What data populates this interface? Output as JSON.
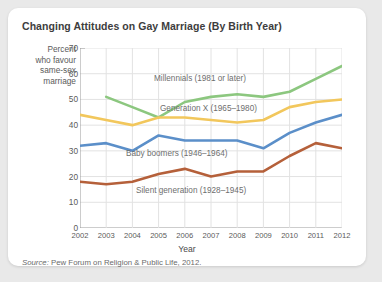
{
  "card": {
    "title": "Changing Attitudes on Gay Marriage (By Birth Year)",
    "source_prefix": "Source:",
    "source_text": " Pew Forum on Religion & Public Life, 2012."
  },
  "axis": {
    "y_axis_caption": "Percent who favour same-sex marriage",
    "y_axis_caption_lines": [
      "Percent",
      "who favour",
      "same-sex",
      "marriage"
    ],
    "x_axis_title": "Year",
    "y_ticks": [
      "0",
      "10",
      "20",
      "30",
      "40",
      "50",
      "60",
      "70"
    ],
    "x_ticks": [
      "2002",
      "2003",
      "2004",
      "2005",
      "2006",
      "2007",
      "2008",
      "2009",
      "2010",
      "2011",
      "2012"
    ]
  },
  "colors": {
    "millennials": "#8CC77F",
    "generation_x": "#F2C75C",
    "baby_boomers": "#5B8FC9",
    "silent_generation": "#B5603A",
    "grid": "#e2e2e2",
    "axis": "#9a9a9a",
    "card_bg": "#ffffff",
    "page_bg": "#e9e9e9",
    "title_text": "#3d3d3d",
    "label_text": "#6e6e6e"
  },
  "series_labels": {
    "millennials": "Millennials (1981 or later)",
    "generation_x": "Generation X (1965–1980)",
    "baby_boomers": "Baby boomers (1946–1964)",
    "silent_generation": "Silent generation (1928–1945)"
  },
  "chart_data": {
    "type": "line",
    "title": "Changing Attitudes on Gay Marriage (By Birth Year)",
    "xlabel": "Year",
    "ylabel": "Percent who favour same-sex marriage",
    "x": [
      2002,
      2003,
      2004,
      2005,
      2006,
      2007,
      2008,
      2009,
      2010,
      2011,
      2012
    ],
    "xlim": [
      2002,
      2012
    ],
    "ylim": [
      0,
      70
    ],
    "ytick_step": 10,
    "grid": true,
    "legend": "inline-labels",
    "series": [
      {
        "name": "Millennials (1981 or later)",
        "color": "#8CC77F",
        "start_year": 2003,
        "x": [
          2003,
          2004,
          2005,
          2006,
          2007,
          2008,
          2009,
          2010,
          2011,
          2012
        ],
        "values": [
          51,
          47,
          43,
          49,
          51,
          52,
          51,
          53,
          58,
          63
        ]
      },
      {
        "name": "Generation X (1965–1980)",
        "color": "#F2C75C",
        "x": [
          2002,
          2003,
          2004,
          2005,
          2006,
          2007,
          2008,
          2009,
          2010,
          2011,
          2012
        ],
        "values": [
          44,
          42,
          40,
          43,
          43,
          42,
          41,
          42,
          47,
          49,
          50
        ]
      },
      {
        "name": "Baby boomers (1946–1964)",
        "color": "#5B8FC9",
        "x": [
          2002,
          2003,
          2004,
          2005,
          2006,
          2007,
          2008,
          2009,
          2010,
          2011,
          2012
        ],
        "values": [
          32,
          33,
          30,
          36,
          34,
          34,
          34,
          31,
          37,
          41,
          44
        ]
      },
      {
        "name": "Silent generation (1928–1945)",
        "color": "#B5603A",
        "x": [
          2002,
          2003,
          2004,
          2005,
          2006,
          2007,
          2008,
          2009,
          2010,
          2011,
          2012
        ],
        "values": [
          18,
          17,
          18,
          21,
          23,
          20,
          22,
          22,
          28,
          33,
          31
        ]
      }
    ]
  }
}
